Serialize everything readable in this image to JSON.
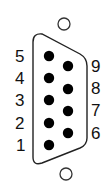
{
  "diagram": {
    "colors": {
      "outline": "#222222",
      "pin": "#000000",
      "text": "#111111",
      "background": "#ffffff"
    },
    "left_pins": [
      {
        "label": "5",
        "cx": 49,
        "cy": 56
      },
      {
        "label": "4",
        "cx": 49,
        "cy": 78
      },
      {
        "label": "3",
        "cx": 49,
        "cy": 100
      },
      {
        "label": "2",
        "cx": 49,
        "cy": 123
      },
      {
        "label": "1",
        "cx": 49,
        "cy": 145
      }
    ],
    "right_pins": [
      {
        "label": "9",
        "cx": 68,
        "cy": 66
      },
      {
        "label": "8",
        "cx": 68,
        "cy": 89
      },
      {
        "label": "7",
        "cx": 68,
        "cy": 111
      },
      {
        "label": "6",
        "cx": 68,
        "cy": 133
      }
    ],
    "mounting_holes": [
      "top-mounting-hole",
      "bottom-mounting-hole"
    ]
  }
}
